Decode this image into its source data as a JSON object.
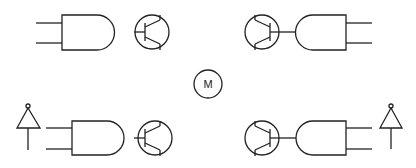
{
  "diagram": {
    "type": "H-bridge motor driver schematic",
    "stroke_color": "#222222",
    "background": "#ffffff",
    "motor": {
      "label": "M",
      "cx": 208,
      "cy": 84,
      "r": 14
    },
    "gates": [
      {
        "id": "and-top-left",
        "orientation": "right",
        "x": 62,
        "y": 15,
        "w": 35,
        "h": 35,
        "pin_y": [
          23,
          43
        ],
        "pin_x0": 36
      },
      {
        "id": "and-top-right",
        "orientation": "left",
        "x": 312,
        "y": 15,
        "w": 34,
        "h": 35,
        "pin_y": [
          23,
          43
        ],
        "pin_x1": 372
      },
      {
        "id": "and-bottom-left",
        "orientation": "right",
        "x": 72,
        "y": 121,
        "w": 35,
        "h": 34,
        "pin_y": [
          128,
          149
        ],
        "pin_x0": 46
      },
      {
        "id": "and-bottom-right",
        "orientation": "left",
        "x": 312,
        "y": 121,
        "w": 34,
        "h": 34,
        "pin_y": [
          128,
          149
        ],
        "pin_x1": 372
      }
    ],
    "transistors": [
      {
        "id": "q-top-left",
        "facing": "left",
        "cx": 152,
        "cy": 32,
        "r": 17
      },
      {
        "id": "q-top-right",
        "facing": "right",
        "cx": 262,
        "cy": 32,
        "r": 17
      },
      {
        "id": "q-bottom-left",
        "facing": "left",
        "cx": 155,
        "cy": 138,
        "r": 17
      },
      {
        "id": "q-bottom-right",
        "facing": "right",
        "cx": 262,
        "cy": 138,
        "r": 17
      }
    ],
    "supply_symbols": [
      {
        "id": "vcc-left",
        "apex_x": 28,
        "apex_y": 108
      },
      {
        "id": "vcc-right",
        "apex_x": 391,
        "apex_y": 108
      }
    ]
  }
}
